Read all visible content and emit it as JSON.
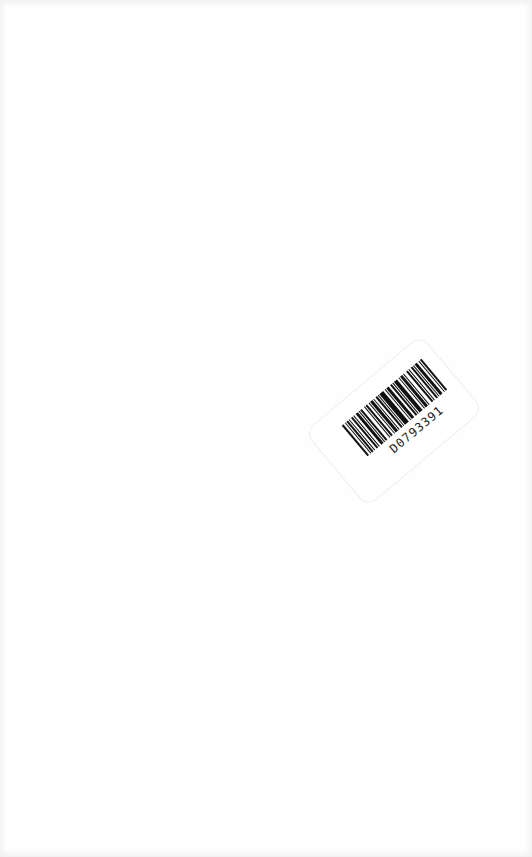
{
  "page": {
    "background": "#fefefe"
  },
  "sticker": {
    "barcode_number": "D0793391",
    "icon": "barcode-icon",
    "rotation_deg": -40
  }
}
